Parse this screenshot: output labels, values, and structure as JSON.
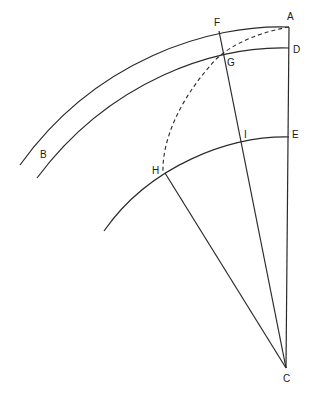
{
  "diagram": {
    "points": {
      "A": {
        "label": "A",
        "x": 289,
        "y": 27
      },
      "B": {
        "label": "B"
      },
      "C": {
        "label": "C",
        "x": 286,
        "y": 368
      },
      "D": {
        "label": "D",
        "x": 289,
        "y": 48
      },
      "E": {
        "label": "E",
        "x": 289,
        "y": 137
      },
      "F": {
        "label": "F",
        "x": 220,
        "y": 32
      },
      "G": {
        "label": "G",
        "x": 223,
        "y": 56
      },
      "H": {
        "label": "H",
        "x": 165,
        "y": 173
      },
      "I": {
        "label": "I",
        "x": 243,
        "y": 140
      }
    },
    "elements": [
      {
        "type": "arc",
        "name": "outer-arc",
        "through": [
          "A",
          "F",
          "B"
        ]
      },
      {
        "type": "arc",
        "name": "inner-arc",
        "through": [
          "D",
          "G"
        ]
      },
      {
        "type": "arc",
        "name": "lower-arc",
        "through": [
          "E",
          "I",
          "H"
        ]
      },
      {
        "type": "dashed-arc",
        "name": "dashed-arc",
        "through": [
          "A",
          "G",
          "H"
        ]
      },
      {
        "type": "line",
        "name": "line-AC",
        "from": "A",
        "to": "C"
      },
      {
        "type": "line",
        "name": "line-FC",
        "from": "F",
        "to": "C"
      },
      {
        "type": "line",
        "name": "line-HC",
        "from": "H",
        "to": "C"
      }
    ]
  }
}
